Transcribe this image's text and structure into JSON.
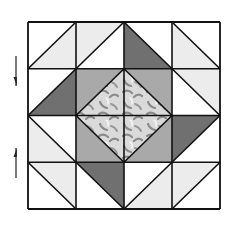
{
  "diagram": {
    "type": "4x4 half-square-triangle quilt block with center square-in-square",
    "grid": {
      "rows": 4,
      "cols": 4,
      "origin_x": 28,
      "origin_y": 22,
      "cell_w": 48,
      "cell_h": 46.75
    },
    "colors": {
      "white": "#ffffff",
      "light": "#ececec",
      "medium": "#a9a9a9",
      "dark": "#707070",
      "print_bg": "#dadada",
      "print_swirl": "#8c8c8c",
      "line": "#111111"
    },
    "cells": [
      {
        "row": 0,
        "col": 0,
        "diag": "/",
        "a": "white",
        "b": "light"
      },
      {
        "row": 0,
        "col": 1,
        "diag": "/",
        "a": "light",
        "b": "white"
      },
      {
        "row": 0,
        "col": 2,
        "diag": "\\",
        "a": "white",
        "b": "dark"
      },
      {
        "row": 0,
        "col": 3,
        "diag": "\\",
        "a": "white",
        "b": "light"
      },
      {
        "row": 1,
        "col": 0,
        "diag": "/",
        "a": "white",
        "b": "dark"
      },
      {
        "row": 1,
        "col": 1,
        "diag": "/",
        "a": "medium",
        "b": "print"
      },
      {
        "row": 1,
        "col": 2,
        "diag": "\\",
        "a": "medium",
        "b": "print"
      },
      {
        "row": 1,
        "col": 3,
        "diag": "\\",
        "a": "light",
        "b": "white"
      },
      {
        "row": 2,
        "col": 0,
        "diag": "\\",
        "a": "white",
        "b": "light"
      },
      {
        "row": 2,
        "col": 1,
        "diag": "\\",
        "a": "print",
        "b": "medium"
      },
      {
        "row": 2,
        "col": 2,
        "diag": "/",
        "a": "print",
        "b": "medium"
      },
      {
        "row": 2,
        "col": 3,
        "diag": "/",
        "a": "dark",
        "b": "white"
      },
      {
        "row": 3,
        "col": 0,
        "diag": "\\",
        "a": "light",
        "b": "white"
      },
      {
        "row": 3,
        "col": 1,
        "diag": "\\",
        "a": "dark",
        "b": "white"
      },
      {
        "row": 3,
        "col": 2,
        "diag": "/",
        "a": "white",
        "b": "light"
      },
      {
        "row": 3,
        "col": 3,
        "diag": "/",
        "a": "light",
        "b": "white"
      }
    ],
    "cell_note": "For '/' diagonals: a = upper-left triangle, b = lower-right triangle. For '\\' diagonals: a = upper-right triangle, b = lower-left triangle.",
    "arrows": [
      {
        "name": "arrow-down",
        "x": 16,
        "y1": 56,
        "y2": 86,
        "direction": "down"
      },
      {
        "name": "arrow-up",
        "x": 16,
        "y1": 148,
        "y2": 178,
        "direction": "up"
      }
    ]
  }
}
